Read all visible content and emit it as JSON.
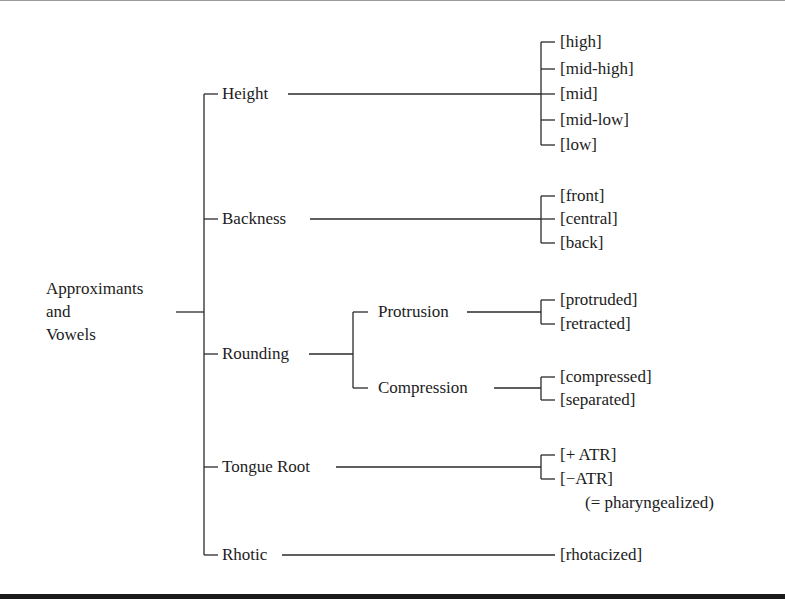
{
  "diagram": {
    "root": {
      "label_lines": [
        "Approximants",
        "and",
        "Vowels"
      ]
    },
    "features": [
      {
        "label": "Height",
        "values": [
          "[high]",
          "[mid-high]",
          "[mid]",
          "[mid-low]",
          "[low]"
        ]
      },
      {
        "label": "Backness",
        "values": [
          "[front]",
          "[central]",
          "[back]"
        ]
      },
      {
        "label": "Rounding",
        "subfeatures": [
          {
            "label": "Protrusion",
            "values": [
              "[protruded]",
              "[retracted]"
            ]
          },
          {
            "label": "Compression",
            "values": [
              "[compressed]",
              "[separated]"
            ]
          }
        ]
      },
      {
        "label": "Tongue Root",
        "values": [
          "[+ ATR]",
          "[−ATR]"
        ],
        "note": "(= pharyngealized)"
      },
      {
        "label": "Rhotic",
        "values": [
          "[rhotacized]"
        ]
      }
    ],
    "colors": {
      "line": "#2a2a2a",
      "text": "#1c1c1c",
      "background": "#ffffff",
      "rule": "#1a1a1a"
    }
  }
}
